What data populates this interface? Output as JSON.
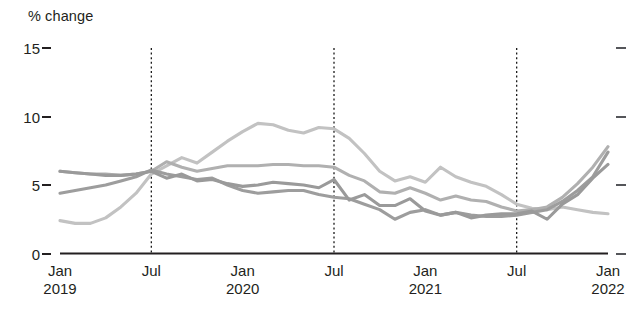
{
  "chart_data": {
    "type": "line",
    "title": "",
    "subtitle": "",
    "ylabel": "% change",
    "xlabel": "",
    "ylim": [
      0,
      15
    ],
    "yticks": [
      0,
      5,
      10,
      15
    ],
    "ytick_labels": [
      "0",
      "5",
      "10",
      "15"
    ],
    "grid": false,
    "legend": "none",
    "right_axis_ticks": [
      0,
      5,
      10,
      15
    ],
    "x_axis_type": "monthly",
    "x_start": "2019-01",
    "x_end": "2022-01",
    "xtick_positions": [
      "2019-01",
      "2019-07",
      "2020-01",
      "2020-07",
      "2021-01",
      "2021-07",
      "2022-01"
    ],
    "xtick_labels": [
      {
        "month": "Jan",
        "year": "2019"
      },
      {
        "month": "Jul",
        "year": ""
      },
      {
        "month": "Jan",
        "year": "2020"
      },
      {
        "month": "Jul",
        "year": ""
      },
      {
        "month": "Jan",
        "year": "2021"
      },
      {
        "month": "Jul",
        "year": ""
      },
      {
        "month": "Jan",
        "year": "2022"
      }
    ],
    "annotations": [
      {
        "type": "vline",
        "x": "2019-07",
        "style": "dotted"
      },
      {
        "type": "vline",
        "x": "2020-07",
        "style": "dotted"
      },
      {
        "type": "vline",
        "x": "2021-07",
        "style": "dotted"
      }
    ],
    "colors": {
      "series_light": "#c2c2c2",
      "series_mid": "#b0b0b0",
      "series_dark": "#9d9d9d",
      "series_darker": "#9a9a9a",
      "axis": "#231f20",
      "divider": "#1a1a1a",
      "text": "#231f20"
    },
    "x": [
      "2019-01",
      "2019-02",
      "2019-03",
      "2019-04",
      "2019-05",
      "2019-06",
      "2019-07",
      "2019-08",
      "2019-09",
      "2019-10",
      "2019-11",
      "2019-12",
      "2020-01",
      "2020-02",
      "2020-03",
      "2020-04",
      "2020-05",
      "2020-06",
      "2020-07",
      "2020-08",
      "2020-09",
      "2020-10",
      "2020-11",
      "2020-12",
      "2021-01",
      "2021-02",
      "2021-03",
      "2021-04",
      "2021-05",
      "2021-06",
      "2021-07",
      "2021-08",
      "2021-09",
      "2021-10",
      "2021-11",
      "2021-12",
      "2022-01"
    ],
    "series": [
      {
        "name": "series-1",
        "color": "#c2c2c2",
        "values": [
          2.4,
          2.2,
          2.2,
          2.6,
          3.4,
          4.4,
          5.8,
          6.4,
          7.0,
          6.6,
          7.4,
          8.2,
          8.9,
          9.5,
          9.4,
          9.0,
          8.8,
          9.2,
          9.1,
          8.4,
          7.3,
          6.0,
          5.3,
          5.6,
          5.2,
          6.3,
          5.6,
          5.2,
          4.9,
          4.3,
          3.6,
          3.3,
          3.2,
          3.4,
          3.2,
          3.0,
          2.9
        ]
      },
      {
        "name": "series-2",
        "color": "#b0b0b0",
        "values": [
          6.0,
          5.9,
          5.8,
          5.8,
          5.7,
          5.8,
          6.0,
          6.7,
          6.3,
          6.0,
          6.2,
          6.4,
          6.4,
          6.4,
          6.5,
          6.5,
          6.4,
          6.4,
          6.3,
          5.7,
          5.3,
          4.5,
          4.4,
          4.8,
          4.4,
          3.9,
          4.2,
          3.9,
          3.8,
          3.4,
          3.1,
          3.2,
          3.4,
          4.1,
          5.1,
          6.3,
          7.8
        ]
      },
      {
        "name": "series-3",
        "color": "#9d9d9d",
        "values": [
          4.4,
          4.6,
          4.8,
          5.0,
          5.3,
          5.6,
          6.1,
          5.8,
          5.6,
          5.4,
          5.5,
          5.0,
          4.6,
          4.4,
          4.5,
          4.6,
          4.6,
          4.3,
          4.1,
          4.0,
          3.6,
          3.2,
          2.5,
          3.0,
          3.2,
          2.8,
          3.0,
          2.8,
          2.7,
          2.7,
          2.8,
          3.0,
          3.2,
          3.8,
          4.6,
          5.6,
          7.4
        ]
      },
      {
        "name": "series-4",
        "color": "#9a9a9a",
        "values": [
          6.0,
          5.9,
          5.8,
          5.7,
          5.7,
          5.8,
          6.0,
          5.5,
          5.8,
          5.3,
          5.4,
          5.1,
          4.9,
          5.0,
          5.2,
          5.1,
          5.0,
          4.8,
          5.4,
          3.9,
          4.3,
          3.5,
          3.5,
          4.0,
          3.1,
          2.8,
          3.0,
          2.6,
          2.8,
          2.9,
          2.9,
          3.1,
          2.5,
          3.6,
          4.3,
          5.5,
          6.5
        ]
      }
    ]
  },
  "axis": {
    "ylabel": "% change"
  }
}
